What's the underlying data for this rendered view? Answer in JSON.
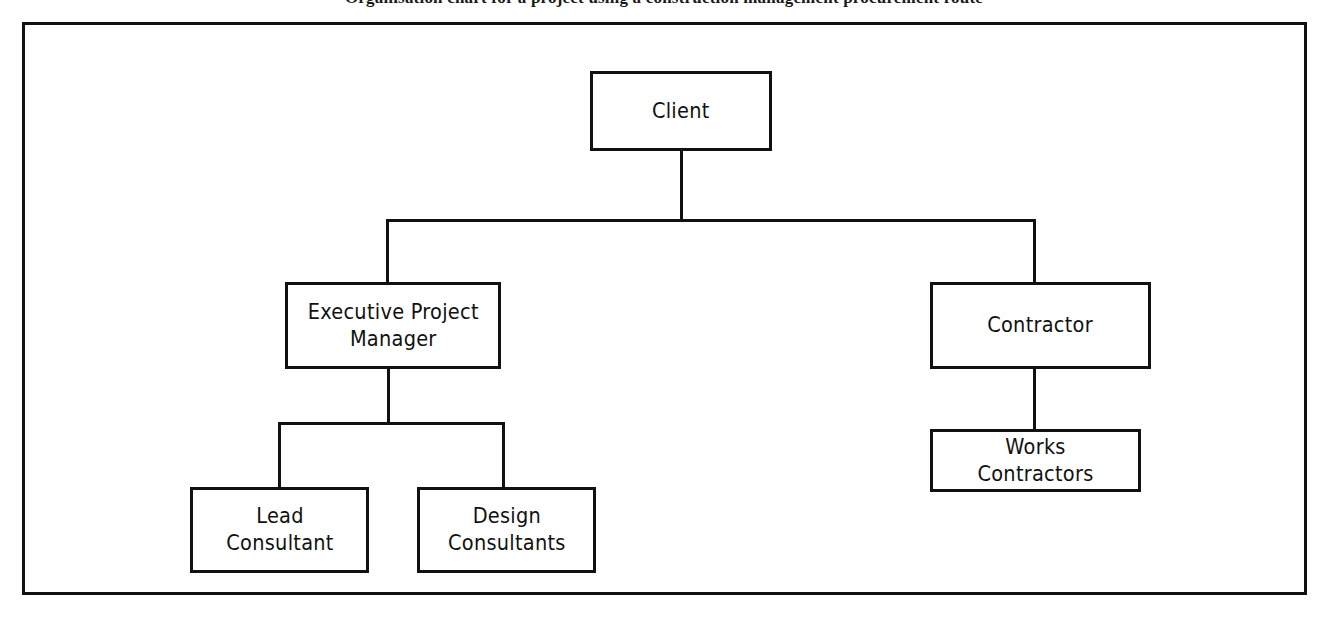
{
  "caption": {
    "text": "Organisation chart for a project using a construction management procurement route"
  },
  "diagram": {
    "type": "org-chart",
    "style": {
      "background": "#ffffff",
      "line_color": "#111111",
      "text_color": "#111111",
      "frame_border_px": 3,
      "node_border_px": 3
    },
    "nodes": [
      {
        "id": "client",
        "label": "Client",
        "level": 0,
        "x": 590,
        "y": 71,
        "w": 182,
        "h": 80
      },
      {
        "id": "exec-pm",
        "label": "Executive Project\nManager",
        "level": 1,
        "x": 285,
        "y": 282,
        "w": 216,
        "h": 87
      },
      {
        "id": "contractor",
        "label": "Contractor",
        "level": 1,
        "x": 930,
        "y": 282,
        "w": 221,
        "h": 87
      },
      {
        "id": "works-contractors",
        "label": "Works Contractors",
        "level": 2,
        "x": 930,
        "y": 429,
        "w": 211,
        "h": 63
      },
      {
        "id": "lead-consultant",
        "label": "Lead\nConsultant",
        "level": 2,
        "x": 190,
        "y": 487,
        "w": 179,
        "h": 86
      },
      {
        "id": "design-consultants",
        "label": "Design\nConsultants",
        "level": 2,
        "x": 417,
        "y": 487,
        "w": 179,
        "h": 86
      }
    ],
    "edges": [
      {
        "from": "client",
        "to": "exec-pm",
        "style": "orthogonal"
      },
      {
        "from": "client",
        "to": "contractor",
        "style": "orthogonal"
      },
      {
        "from": "exec-pm",
        "to": "lead-consultant",
        "style": "orthogonal"
      },
      {
        "from": "exec-pm",
        "to": "design-consultants",
        "style": "orthogonal"
      },
      {
        "from": "contractor",
        "to": "works-contractors",
        "style": "straight"
      }
    ]
  }
}
